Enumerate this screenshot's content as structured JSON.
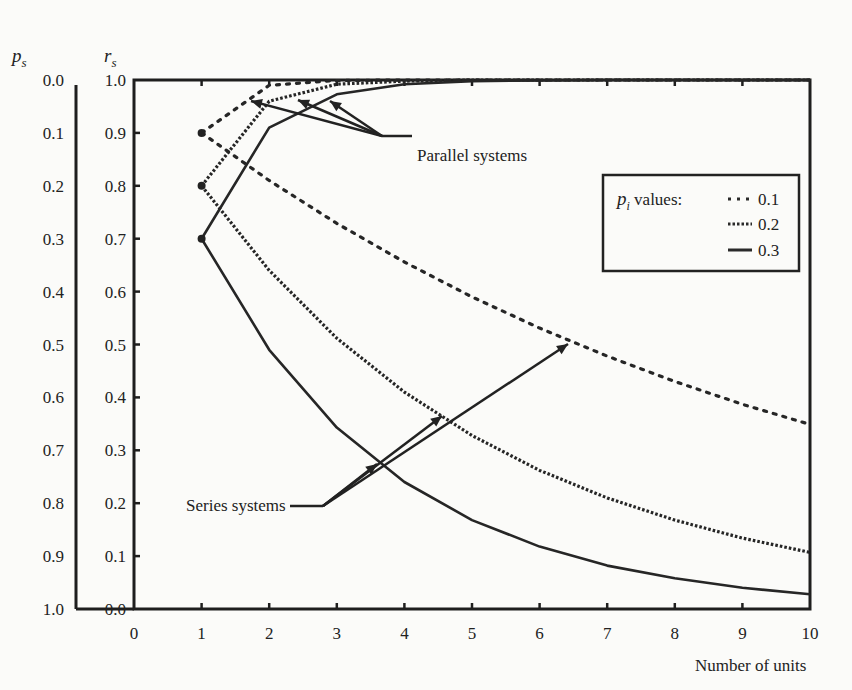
{
  "chart_data": {
    "type": "line",
    "title": "",
    "xlabel": "Number of units",
    "ylabel_left_outer": "p_s",
    "ylabel_left_inner": "r_s",
    "xlim": [
      0,
      10
    ],
    "ylim": [
      0,
      1
    ],
    "x_ticks": [
      "0",
      "1",
      "2",
      "3",
      "4",
      "5",
      "6",
      "7",
      "8",
      "9",
      "10"
    ],
    "rs_ticks": [
      "1.0",
      "0.9",
      "0.8",
      "0.7",
      "0.6",
      "0.5",
      "0.4",
      "0.3",
      "0.2",
      "0.1",
      "0.0"
    ],
    "ps_ticks": [
      "0.0",
      "0.1",
      "0.2",
      "0.3",
      "0.4",
      "0.5",
      "0.6",
      "0.7",
      "0.8",
      "0.9",
      "1.0"
    ],
    "grid": false,
    "legend": {
      "position": "upper right",
      "title": "p_i values:",
      "entries": [
        {
          "label": "0.1",
          "style": "sparse-dotted"
        },
        {
          "label": "0.2",
          "style": "dense-dotted"
        },
        {
          "label": "0.3",
          "style": "solid"
        }
      ]
    },
    "x": [
      1,
      2,
      3,
      4,
      5,
      6,
      7,
      8,
      9,
      10
    ],
    "series": [
      {
        "name": "Series p_i=0.1",
        "p": 0.1,
        "kind": "series",
        "values": [
          0.9,
          0.81,
          0.729,
          0.656,
          0.59,
          0.531,
          0.478,
          0.43,
          0.387,
          0.349
        ]
      },
      {
        "name": "Series p_i=0.2",
        "p": 0.2,
        "kind": "series",
        "values": [
          0.8,
          0.64,
          0.512,
          0.41,
          0.328,
          0.262,
          0.21,
          0.168,
          0.134,
          0.107
        ]
      },
      {
        "name": "Series p_i=0.3",
        "p": 0.3,
        "kind": "series",
        "values": [
          0.7,
          0.49,
          0.343,
          0.24,
          0.168,
          0.118,
          0.082,
          0.058,
          0.04,
          0.028
        ]
      },
      {
        "name": "Parallel p_i=0.1",
        "p": 0.1,
        "kind": "parallel",
        "values": [
          0.9,
          0.99,
          0.999,
          1.0,
          1.0,
          1.0,
          1.0,
          1.0,
          1.0,
          1.0
        ]
      },
      {
        "name": "Parallel p_i=0.2",
        "p": 0.2,
        "kind": "parallel",
        "values": [
          0.8,
          0.96,
          0.992,
          0.998,
          1.0,
          1.0,
          1.0,
          1.0,
          1.0,
          1.0
        ]
      },
      {
        "name": "Parallel p_i=0.3",
        "p": 0.3,
        "kind": "parallel",
        "values": [
          0.7,
          0.91,
          0.973,
          0.992,
          0.998,
          0.999,
          1.0,
          1.0,
          1.0,
          1.0
        ]
      }
    ],
    "annotations": [
      {
        "text": "Parallel systems",
        "points_to": "parallel curves near x=1.5-3"
      },
      {
        "text": "Series systems",
        "points_to": "series curves near x=3.5-6"
      }
    ]
  },
  "labels": {
    "ps": "p",
    "ps_sub": "s",
    "rs": "r",
    "rs_sub": "s",
    "xlabel": "Number of units",
    "parallel": "Parallel systems",
    "series": "Series systems",
    "legend_title_p": "p",
    "legend_title_sub": "i",
    "legend_title_rest": " values:",
    "legend_1": "0.1",
    "legend_2": "0.2",
    "legend_3": "0.3"
  }
}
